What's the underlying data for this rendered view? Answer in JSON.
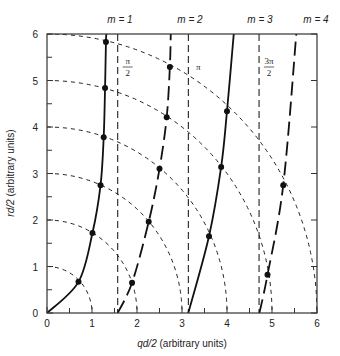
{
  "chart_data": {
    "type": "line",
    "title": "",
    "xlabel": "qd/2 (arbitrary units)",
    "ylabel": "rd/2 (arbitrary units)",
    "xlim": [
      0,
      6
    ],
    "ylim": [
      0,
      6
    ],
    "x_ticks": [
      "0",
      "1",
      "2",
      "3",
      "4",
      "5",
      "6"
    ],
    "y_ticks": [
      "0",
      "1",
      "2",
      "3",
      "4",
      "5",
      "6"
    ],
    "grid": false,
    "mode_labels": [
      "m = 1",
      "m = 2",
      "m = 3",
      "m = 4"
    ],
    "vertical_reference_lines": [
      {
        "x": 1.5708,
        "label_num": "π",
        "label_den": "2"
      },
      {
        "x": 3.1416,
        "label_num": "π",
        "label_den": ""
      },
      {
        "x": 4.7124,
        "label_num": "3π",
        "label_den": "2"
      }
    ],
    "circles": {
      "description": "dashed quarter circles centred at origin",
      "radii": [
        1,
        2,
        3,
        4,
        5,
        6
      ]
    },
    "series": [
      {
        "name": "m = 1",
        "style": "solid",
        "x": [
          0,
          0.7,
          1.01,
          1.19,
          1.26,
          1.29,
          1.31,
          1.32
        ],
        "y": [
          0,
          0.67,
          1.72,
          2.75,
          3.78,
          4.84,
          5.83,
          6.0
        ],
        "markers": [
          [
            0.7,
            0.67
          ],
          [
            1.01,
            1.72
          ],
          [
            1.19,
            2.75
          ],
          [
            1.26,
            3.78
          ],
          [
            1.29,
            4.84
          ],
          [
            1.31,
            5.83
          ]
        ]
      },
      {
        "name": "m = 2",
        "style": "dashed",
        "x": [
          1.57,
          1.89,
          2.26,
          2.5,
          2.66,
          2.73,
          2.75
        ],
        "y": [
          0,
          0.65,
          1.96,
          3.1,
          4.21,
          5.29,
          6.0
        ],
        "markers": [
          [
            1.89,
            0.65
          ],
          [
            2.26,
            1.96
          ],
          [
            2.5,
            3.1
          ],
          [
            2.66,
            4.21
          ],
          [
            2.73,
            5.29
          ]
        ]
      },
      {
        "name": "m = 3",
        "style": "solid",
        "x": [
          3.14,
          3.6,
          3.87,
          4.0,
          4.15
        ],
        "y": [
          0,
          1.65,
          3.14,
          4.34,
          6.0
        ],
        "markers": [
          [
            3.6,
            1.65
          ],
          [
            3.87,
            3.14
          ],
          [
            4.0,
            4.34
          ]
        ]
      },
      {
        "name": "m = 4",
        "style": "dashed",
        "x": [
          4.72,
          4.9,
          5.25,
          5.54
        ],
        "y": [
          0,
          0.82,
          2.75,
          6.0
        ],
        "markers": [
          [
            4.9,
            0.82
          ],
          [
            5.25,
            2.75
          ]
        ]
      }
    ]
  }
}
